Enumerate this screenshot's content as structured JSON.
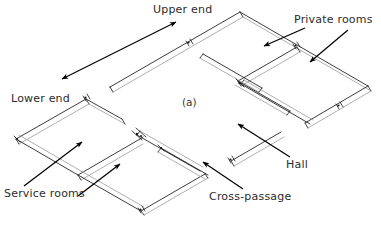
{
  "figure": {
    "caption": "(a)",
    "type": "isometric-floor-plan",
    "footer_note": ""
  },
  "annotations": [
    {
      "id": "upper-end",
      "label": "Upper end",
      "text_x": 153,
      "text_y": 12,
      "arrows": [
        {
          "x1": 176,
          "y1": 22,
          "x2": 62,
          "y2": 79,
          "head": "both"
        }
      ]
    },
    {
      "id": "private-rooms",
      "label": "Private rooms",
      "text_x": 294,
      "text_y": 22,
      "arrows": [
        {
          "x1": 305,
          "y1": 28,
          "x2": 262,
          "y2": 47,
          "head": "end"
        },
        {
          "x1": 345,
          "y1": 28,
          "x2": 388,
          "y2": 65,
          "head": "end"
        }
      ]
    },
    {
      "id": "lower-end",
      "label": "Lower end",
      "text_x": 11,
      "text_y": 101,
      "arrows": []
    },
    {
      "id": "hall",
      "label": "Hall",
      "text_x": 285,
      "text_y": 167,
      "arrows": [
        {
          "x1": 288,
          "y1": 158,
          "x2": 238,
          "y2": 124,
          "head": "end"
        }
      ]
    },
    {
      "id": "cross-passage",
      "label": "Cross-passage",
      "text_x": 209,
      "text_y": 199,
      "arrows": [
        {
          "x1": 237,
          "y1": 189,
          "x2": 203,
          "y2": 163,
          "head": "end"
        }
      ]
    },
    {
      "id": "service-rooms",
      "label": "Service rooms",
      "text_x": 4,
      "text_y": 196,
      "arrows": [
        {
          "x1": 24,
          "y1": 185,
          "x2": 82,
          "y2": 142,
          "head": "end"
        },
        {
          "x1": 76,
          "y1": 196,
          "x2": 120,
          "y2": 165,
          "head": "end"
        }
      ]
    }
  ],
  "colors": {
    "wall_stroke": "#1a1a1a",
    "wall_stroke_soft": "#9a9a9a",
    "annotation_text": "#2b2b2b",
    "arrow": "#000000",
    "background": "#ffffff"
  }
}
